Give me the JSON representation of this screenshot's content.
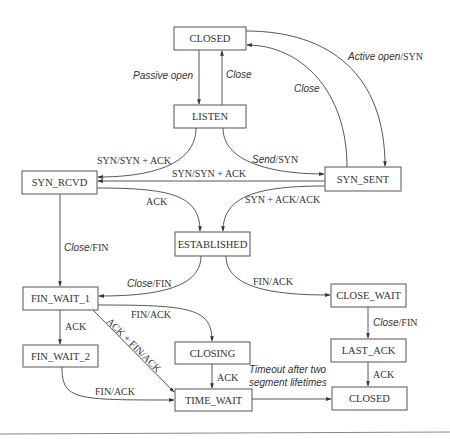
{
  "diagram": {
    "states": {
      "closed_top": "CLOSED",
      "listen": "LISTEN",
      "syn_rcvd": "SYN_RCVD",
      "syn_sent": "SYN_SENT",
      "established": "ESTABLISHED",
      "fin_wait_1": "FIN_WAIT_1",
      "close_wait": "CLOSE_WAIT",
      "fin_wait_2": "FIN_WAIT_2",
      "closing": "CLOSING",
      "last_ack": "LAST_ACK",
      "time_wait": "TIME_WAIT",
      "closed_bottom": "CLOSED"
    },
    "transitions": {
      "passive_open": {
        "event": "Passive open",
        "action": ""
      },
      "close_listen": {
        "event": "Close",
        "action": ""
      },
      "active_open": {
        "event": "Active open",
        "action": "/SYN"
      },
      "close_syn_sent": {
        "event": "Close",
        "action": ""
      },
      "listen_syn": {
        "event": "",
        "action": "SYN/SYN + ACK"
      },
      "send_syn": {
        "event": "Send",
        "action": "/SYN"
      },
      "simultaneous_syn": {
        "event": "",
        "action": "SYN/SYN + ACK"
      },
      "ack_established": {
        "event": "",
        "action": "ACK"
      },
      "synack_ack": {
        "event": "",
        "action": "SYN + ACK/ACK"
      },
      "syn_rcvd_close": {
        "event": "Close",
        "action": "/FIN"
      },
      "est_close": {
        "event": "Close",
        "action": "/FIN"
      },
      "est_fin": {
        "event": "",
        "action": "FIN/ACK"
      },
      "fw1_ack": {
        "event": "",
        "action": "ACK"
      },
      "fw1_fin": {
        "event": "",
        "action": "FIN/ACK"
      },
      "fw1_ackfin": {
        "event": "",
        "action": "ACK + FIN/ACK"
      },
      "cw_close": {
        "event": "Close",
        "action": "/FIN"
      },
      "closing_ack": {
        "event": "",
        "action": "ACK"
      },
      "la_ack": {
        "event": "",
        "action": "ACK"
      },
      "fw2_fin": {
        "event": "",
        "action": "FIN/ACK"
      },
      "timeout_line1": {
        "event": "Timeout after two",
        "action": ""
      },
      "timeout_line2": {
        "event": "segment lifetimes",
        "action": ""
      }
    }
  }
}
